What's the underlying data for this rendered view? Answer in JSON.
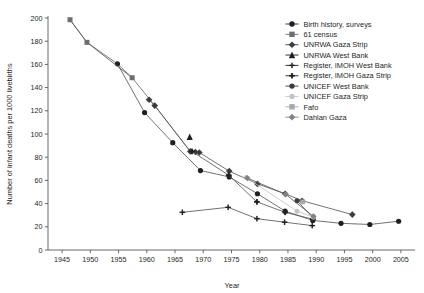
{
  "chart_data": {
    "type": "line",
    "title": "",
    "xlabel": "Year",
    "ylabel": "Number of infant deaths per 1000 livebirths",
    "xlim": [
      1942.5,
      2007.5
    ],
    "ylim": [
      0,
      200
    ],
    "xticks": [
      1945,
      1950,
      1955,
      1960,
      1965,
      1970,
      1975,
      1980,
      1985,
      1990,
      1995,
      2000,
      2005
    ],
    "yticks": [
      0,
      20,
      40,
      60,
      80,
      100,
      120,
      140,
      160,
      180,
      200
    ],
    "grid": false,
    "legend_position": "top-right",
    "series": [
      {
        "name": "Birth history, surveys",
        "marker": "circle",
        "color": "#231f20",
        "size": 5.2,
        "points": [
          {
            "x": 1954.8,
            "y": 160.5
          },
          {
            "x": 1959.6,
            "y": 118.5
          },
          {
            "x": 1964.6,
            "y": 92.5
          },
          {
            "x": 1969.5,
            "y": 68.5
          },
          {
            "x": 1974.6,
            "y": 63.0
          },
          {
            "x": 1979.6,
            "y": 48.5
          },
          {
            "x": 1984.5,
            "y": 33.5
          },
          {
            "x": 1989.4,
            "y": 25.5
          },
          {
            "x": 1994.4,
            "y": 23.0
          },
          {
            "x": 1999.5,
            "y": 22.0
          },
          {
            "x": 2004.6,
            "y": 24.8
          }
        ]
      },
      {
        "name": "61 census",
        "marker": "square",
        "color": "#6d6e71",
        "size": 5.0,
        "points": [
          {
            "x": 1946.4,
            "y": 198.5
          },
          {
            "x": 1949.4,
            "y": 179.0
          },
          {
            "x": 1957.4,
            "y": 148.5
          }
        ]
      },
      {
        "name": "UNRWA Gaza Strip",
        "marker": "diamond",
        "color": "#3c3b3d",
        "size": 5.4,
        "points": [
          {
            "x": 1960.4,
            "y": 129.5
          },
          {
            "x": 1961.4,
            "y": 124.5
          },
          {
            "x": 1967.7,
            "y": 85.0
          },
          {
            "x": 1968.6,
            "y": 84.5
          },
          {
            "x": 1969.3,
            "y": 84.0
          },
          {
            "x": 1974.6,
            "y": 68.0
          },
          {
            "x": 1979.6,
            "y": 57.0
          },
          {
            "x": 1984.5,
            "y": 48.5
          },
          {
            "x": 1987.5,
            "y": 42.5
          },
          {
            "x": 1996.4,
            "y": 30.5
          }
        ]
      },
      {
        "name": "UNRWA West Bank",
        "marker": "triangle",
        "color": "#231f20",
        "size": 5.2,
        "points": [
          {
            "x": 1967.6,
            "y": 97.5
          }
        ]
      },
      {
        "name": "Register, IMOH West Bank",
        "marker": "plus",
        "color": "#231f20",
        "size": 5.6,
        "points": [
          {
            "x": 1966.3,
            "y": 32.5
          },
          {
            "x": 1974.4,
            "y": 36.8
          },
          {
            "x": 1979.5,
            "y": 27.0
          },
          {
            "x": 1984.4,
            "y": 24.0
          },
          {
            "x": 1989.3,
            "y": 21.0
          }
        ]
      },
      {
        "name": "Register, IMOH Gaza Strip",
        "marker": "plus-square",
        "color": "#231f20",
        "size": 5.6,
        "points": [
          {
            "x": 1968.0,
            "y": 85.0
          },
          {
            "x": 1974.5,
            "y": 64.5
          },
          {
            "x": 1979.5,
            "y": 41.5
          },
          {
            "x": 1984.5,
            "y": 32.5
          },
          {
            "x": 1989.4,
            "y": 26.5
          }
        ]
      },
      {
        "name": "UNICEF West Bank",
        "marker": "circle",
        "color": "#3c3b3d",
        "size": 5.0,
        "points": [
          {
            "x": 1986.6,
            "y": 42.5
          },
          {
            "x": 1989.5,
            "y": 27.5
          }
        ]
      },
      {
        "name": "UNICEF Gaza Strip",
        "marker": "circle",
        "color": "#c3c4c6",
        "size": 5.0,
        "points": [
          {
            "x": 1977.6,
            "y": 62.5
          },
          {
            "x": 1986.6,
            "y": 33.5
          },
          {
            "x": 1989.5,
            "y": 28.5
          }
        ]
      },
      {
        "name": "Fafo",
        "marker": "square",
        "color": "#a7a9ac",
        "size": 4.8,
        "points": [
          {
            "x": 1987.6,
            "y": 41.5
          }
        ]
      },
      {
        "name": "Dahlan Gaza",
        "marker": "diamond",
        "color": "#808285",
        "size": 5.0,
        "points": [
          {
            "x": 1977.8,
            "y": 62.0
          },
          {
            "x": 1984.6,
            "y": 48.0
          },
          {
            "x": 1989.5,
            "y": 29.0
          }
        ]
      }
    ],
    "legend_entries": [
      {
        "label": "Birth history, surveys",
        "marker": "circle",
        "color": "#231f20"
      },
      {
        "label": "61 census",
        "marker": "square",
        "color": "#6d6e71"
      },
      {
        "label": "UNRWA Gaza Strip",
        "marker": "diamond",
        "color": "#3c3b3d"
      },
      {
        "label": "UNRWA West Bank",
        "marker": "triangle",
        "color": "#231f20"
      },
      {
        "label": "Register, IMOH West Bank",
        "marker": "plus",
        "color": "#231f20"
      },
      {
        "label": "Register, IMOH Gaza Strip",
        "marker": "plus-square",
        "color": "#231f20"
      },
      {
        "label": "UNICEF West Bank",
        "marker": "circle",
        "color": "#3c3b3d"
      },
      {
        "label": "UNICEF Gaza Strip",
        "marker": "circle",
        "color": "#c3c4c6"
      },
      {
        "label": "Fafo",
        "marker": "square",
        "color": "#a7a9ac"
      },
      {
        "label": "Dahlan Gaza",
        "marker": "diamond",
        "color": "#808285"
      }
    ],
    "connector_paths": [
      {
        "name": "census-to-birth-link",
        "color": "#6d6e71",
        "points": [
          {
            "x": 1946.4,
            "y": 198.5
          },
          {
            "x": 1949.4,
            "y": 179.0
          },
          {
            "x": 1954.8,
            "y": 160.5
          },
          {
            "x": 1957.4,
            "y": 148.5
          },
          {
            "x": 1961.4,
            "y": 124.5
          },
          {
            "x": 1967.7,
            "y": 85.0
          }
        ]
      }
    ]
  }
}
